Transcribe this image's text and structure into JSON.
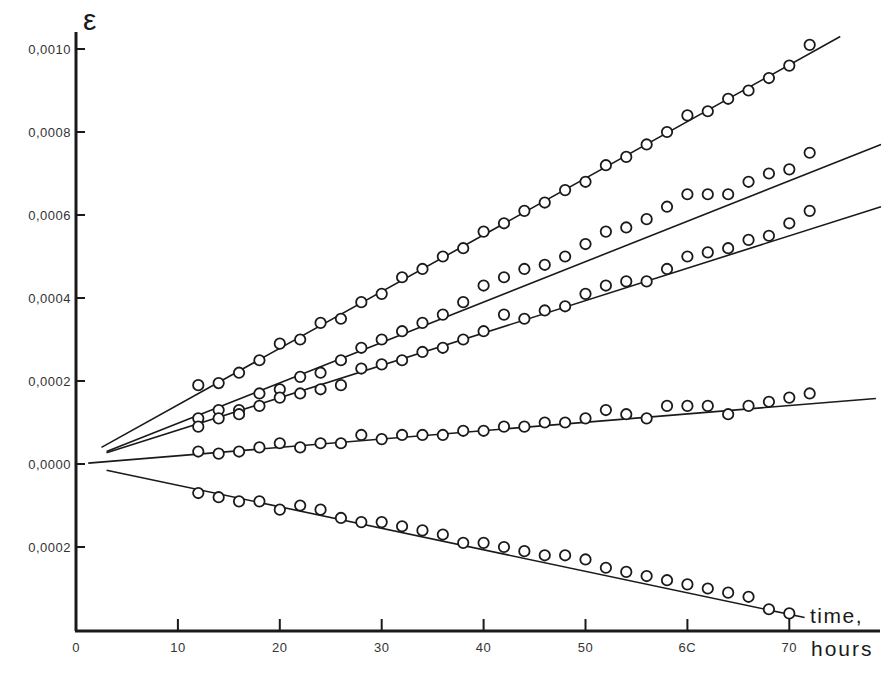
{
  "chart_data": {
    "type": "scatter",
    "title": "",
    "ylabel": "ε",
    "xlabel": "time, hours",
    "xlabel_lines": [
      "time,",
      "hours"
    ],
    "xlim": [
      0,
      75
    ],
    "ylim": [
      -0.00038,
      0.00105
    ],
    "x_ticks": [
      0,
      10,
      20,
      30,
      40,
      50,
      60,
      70
    ],
    "x_tick_labels": [
      "0",
      "10",
      "20",
      "30",
      "40",
      "50",
      "6C",
      "70"
    ],
    "y_ticks": [
      0.001,
      0.0008,
      0.0006,
      0.0004,
      0.0002,
      0.0,
      -0.0002
    ],
    "y_tick_labels": [
      "0,0010",
      "0,0008",
      "0,0006",
      "0,0004",
      "0,0002",
      "0,0000",
      "0,0002"
    ],
    "grid": false,
    "legend": null,
    "marker": "open-circle",
    "series": [
      {
        "name": "series-1",
        "fit_line": {
          "x0": 2.5,
          "y0": 4e-05,
          "x1": 75,
          "y1": 0.00103
        },
        "x": [
          12,
          14,
          16,
          18,
          20,
          22,
          24,
          26,
          28,
          30,
          32,
          34,
          36,
          38,
          40,
          42,
          44,
          46,
          48,
          50,
          52,
          54,
          56,
          58,
          60,
          62,
          64,
          66,
          68,
          70,
          72
        ],
        "y": [
          0.00019,
          0.000195,
          0.00022,
          0.00025,
          0.00029,
          0.0003,
          0.00034,
          0.00035,
          0.00039,
          0.00041,
          0.00045,
          0.00047,
          0.0005,
          0.00052,
          0.00056,
          0.00058,
          0.00061,
          0.00063,
          0.00066,
          0.00068,
          0.00072,
          0.00074,
          0.00077,
          0.0008,
          0.00084,
          0.00085,
          0.00088,
          0.0009,
          0.00093,
          0.00096,
          0.00101
        ]
      },
      {
        "name": "series-2",
        "fit_line": {
          "x0": 3,
          "y0": 3e-05,
          "x1": 79,
          "y1": 0.00077
        },
        "x": [
          12,
          14,
          16,
          18,
          20,
          22,
          24,
          26,
          28,
          30,
          32,
          34,
          36,
          38,
          40,
          42,
          44,
          46,
          48,
          50,
          52,
          54,
          56,
          58,
          60,
          62,
          64,
          66,
          68,
          70,
          72
        ],
        "y": [
          0.00011,
          0.00013,
          0.00013,
          0.00017,
          0.00018,
          0.00021,
          0.00022,
          0.00025,
          0.00028,
          0.0003,
          0.00032,
          0.00034,
          0.00036,
          0.00039,
          0.00043,
          0.00045,
          0.00047,
          0.00048,
          0.0005,
          0.00053,
          0.00056,
          0.00057,
          0.00059,
          0.00062,
          0.00065,
          0.00065,
          0.00065,
          0.00068,
          0.0007,
          0.00071,
          0.00075
        ]
      },
      {
        "name": "series-3",
        "fit_line": {
          "x0": 3,
          "y0": 2.7e-05,
          "x1": 79,
          "y1": 0.00062
        },
        "x": [
          12,
          14,
          16,
          18,
          20,
          22,
          24,
          26,
          28,
          30,
          32,
          34,
          36,
          38,
          40,
          42,
          44,
          46,
          48,
          50,
          52,
          54,
          56,
          58,
          60,
          62,
          64,
          66,
          68,
          70,
          72
        ],
        "y": [
          9e-05,
          0.00011,
          0.00012,
          0.00014,
          0.00016,
          0.00017,
          0.00018,
          0.00019,
          0.00023,
          0.00024,
          0.00025,
          0.00027,
          0.00028,
          0.0003,
          0.00032,
          0.00036,
          0.00035,
          0.00037,
          0.00038,
          0.00041,
          0.00043,
          0.00044,
          0.00044,
          0.00047,
          0.0005,
          0.00051,
          0.00052,
          0.00054,
          0.00055,
          0.00058,
          0.00061
        ]
      },
      {
        "name": "series-4",
        "fit_line": {
          "x0": 1.2,
          "y0": 2e-06,
          "x1": 78.5,
          "y1": 0.000158
        },
        "x": [
          12,
          14,
          16,
          18,
          20,
          22,
          24,
          26,
          28,
          30,
          32,
          34,
          36,
          38,
          40,
          42,
          44,
          46,
          48,
          50,
          52,
          54,
          56,
          58,
          60,
          62,
          64,
          66,
          68,
          70,
          72
        ],
        "y": [
          3e-05,
          2.5e-05,
          3e-05,
          4e-05,
          5e-05,
          4e-05,
          5e-05,
          5e-05,
          7e-05,
          6e-05,
          7e-05,
          7e-05,
          7e-05,
          8e-05,
          8e-05,
          9e-05,
          9e-05,
          0.0001,
          0.0001,
          0.00011,
          0.00013,
          0.00012,
          0.00011,
          0.00014,
          0.00014,
          0.00014,
          0.00012,
          0.00014,
          0.00015,
          0.00016,
          0.00017
        ]
      },
      {
        "name": "series-5",
        "fit_line": {
          "x0": 3,
          "y0": -1.5e-05,
          "x1": 71.5,
          "y1": -0.00037
        },
        "x": [
          12,
          14,
          16,
          18,
          20,
          22,
          24,
          26,
          28,
          30,
          32,
          34,
          36,
          38,
          40,
          42,
          44,
          46,
          48,
          50,
          52,
          54,
          56,
          58,
          60,
          62,
          64,
          66,
          68,
          70
        ],
        "y": [
          -7e-05,
          -8e-05,
          -9e-05,
          -9e-05,
          -0.00011,
          -0.0001,
          -0.00011,
          -0.00013,
          -0.00014,
          -0.00014,
          -0.00015,
          -0.00016,
          -0.00017,
          -0.00019,
          -0.00019,
          -0.0002,
          -0.00021,
          -0.00022,
          -0.00022,
          -0.00023,
          -0.00025,
          -0.00026,
          -0.00027,
          -0.00028,
          -0.00029,
          -0.0003,
          -0.00031,
          -0.00032,
          -0.00035,
          -0.00036
        ]
      }
    ]
  },
  "layout": {
    "origin_px": [
      76,
      464
    ],
    "px_per_hour": 10.19,
    "px_per_unit_y": 415000,
    "x_axis_y_px": 631,
    "y_axis_top_px": 32,
    "x_axis_right_px": 880
  },
  "colors": {
    "ink": "#1a1a1a",
    "background": "#ffffff"
  }
}
